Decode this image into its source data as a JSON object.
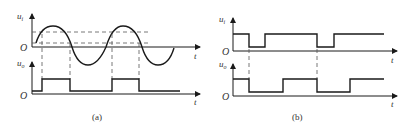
{
  "figure": {
    "panels": [
      {
        "id": "a",
        "caption": "(a)",
        "input_label": "u",
        "input_sub": "i",
        "output_label": "u",
        "output_sub": "o",
        "origin_label": "O",
        "time_label": "t",
        "input_waveform": "sine",
        "output_waveform": "square pulses (hysteresis comparator)",
        "threshold_lines": 2
      },
      {
        "id": "b",
        "caption": "(b)",
        "input_label": "u",
        "input_sub": "i",
        "output_label": "u",
        "output_sub": "o",
        "origin_label": "O",
        "time_label": "t",
        "input_waveform": "square with negative-going dips",
        "output_waveform": "square pulses (triggered falling edges)"
      }
    ],
    "colors": {
      "line": "#1a1a1a",
      "dashed": "#555555",
      "text": "#333333"
    }
  }
}
